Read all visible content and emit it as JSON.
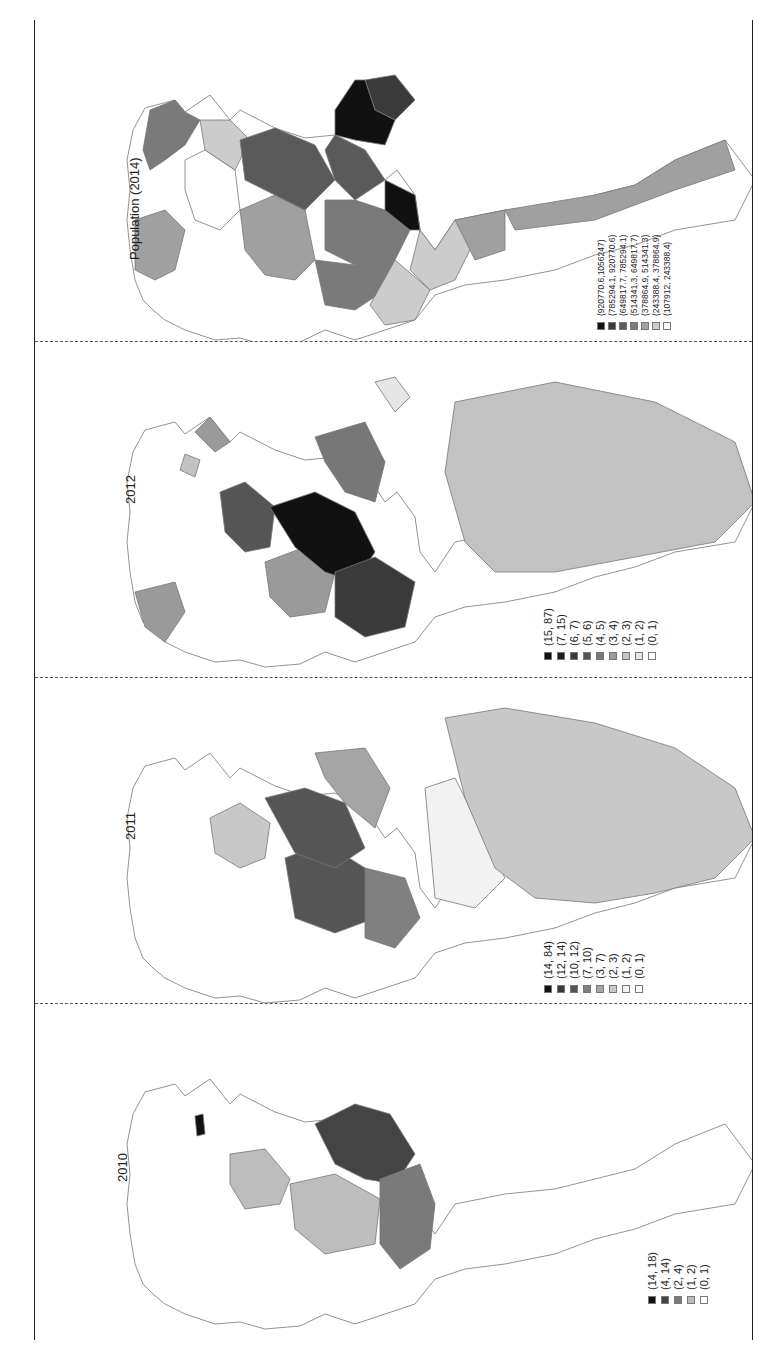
{
  "figure": {
    "orientation": "rotated-90-ccw",
    "panels": [
      {
        "id": "pop2014",
        "title": "Population (2014)",
        "legend": [
          {
            "label": "(920770.6,1056247)",
            "color": "#111111"
          },
          {
            "label": "(785294.1, 920770.6)",
            "color": "#3a3a3a"
          },
          {
            "label": "(649817.7, 785294.1)",
            "color": "#5a5a5a"
          },
          {
            "label": "(514341.3, 649817.7)",
            "color": "#7a7a7a"
          },
          {
            "label": "(378864.9, 514341.3)",
            "color": "#a0a0a0"
          },
          {
            "label": "(243388.4, 378864.9)",
            "color": "#cccccc"
          },
          {
            "label": "(107912, 243388.4)",
            "color": "#ffffff"
          }
        ]
      },
      {
        "id": "y2012",
        "title": "2012",
        "legend": [
          {
            "label": "(15, 87)",
            "color": "#111111"
          },
          {
            "label": "(7, 15)",
            "color": "#1e1e1e"
          },
          {
            "label": "(6, 7)",
            "color": "#3a3a3a"
          },
          {
            "label": "(5, 6)",
            "color": "#555555"
          },
          {
            "label": "(4, 5)",
            "color": "#777777"
          },
          {
            "label": "(3, 4)",
            "color": "#9a9a9a"
          },
          {
            "label": "(2, 3)",
            "color": "#c2c2c2"
          },
          {
            "label": "(1, 2)",
            "color": "#e6e6e6"
          },
          {
            "label": "(0, 1)",
            "color": "#ffffff"
          }
        ]
      },
      {
        "id": "y2011",
        "title": "2011",
        "legend": [
          {
            "label": "(14, 84)",
            "color": "#111111"
          },
          {
            "label": "(12, 14)",
            "color": "#3a3a3a"
          },
          {
            "label": "(10, 12)",
            "color": "#555555"
          },
          {
            "label": "(7, 10)",
            "color": "#808080"
          },
          {
            "label": "(3, 7)",
            "color": "#a5a5a5"
          },
          {
            "label": "(2, 3)",
            "color": "#c8c8c8"
          },
          {
            "label": "(1, 2)",
            "color": "#f2f2f2"
          },
          {
            "label": "(0, 1)",
            "color": "#ffffff"
          }
        ]
      },
      {
        "id": "y2010",
        "title": "2010",
        "legend": [
          {
            "label": "(14, 18)",
            "color": "#111111"
          },
          {
            "label": "(4, 14)",
            "color": "#444444"
          },
          {
            "label": "(2, 4)",
            "color": "#7a7a7a"
          },
          {
            "label": "(1, 2)",
            "color": "#bdbdbd"
          },
          {
            "label": "(0, 1)",
            "color": "#ffffff"
          }
        ]
      }
    ]
  }
}
